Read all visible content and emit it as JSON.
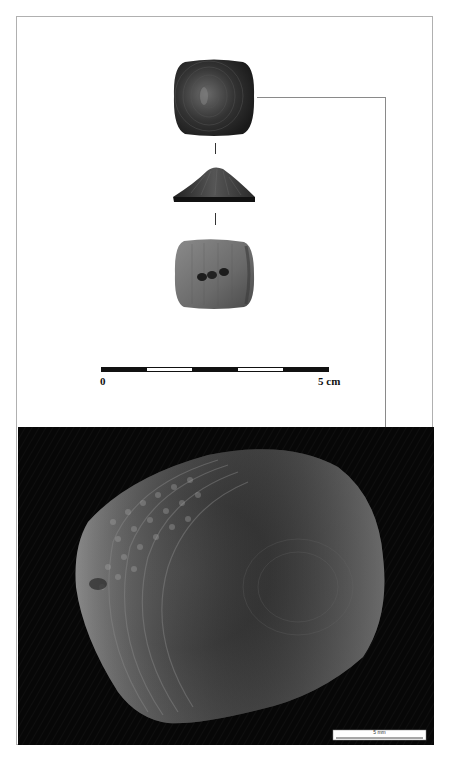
{
  "figure": {
    "views": [
      {
        "name": "top-view",
        "description": "dorsal view of square conical button"
      },
      {
        "name": "side-view",
        "description": "profile view showing conical section"
      },
      {
        "name": "bottom-view",
        "description": "ventral view with perforation holes"
      }
    ],
    "scale_bar": {
      "start_label": "0",
      "end_label": "5 cm",
      "segments": [
        "black",
        "white",
        "black",
        "white",
        "black"
      ]
    },
    "photo": {
      "description": "close-up micrograph of artefact surface with concentric ridges and dotted decoration",
      "scale_label": "5 mm"
    }
  },
  "colors": {
    "background": "#ffffff",
    "frame": "#b0b0b0",
    "connector": "#8a8a8a",
    "photo_background": "#060606"
  }
}
